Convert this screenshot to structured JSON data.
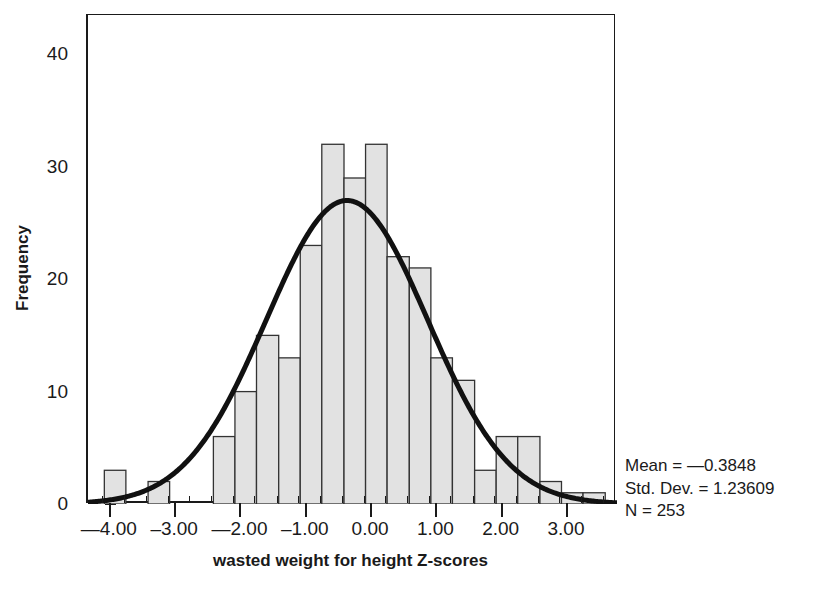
{
  "chart_data": {
    "type": "bar",
    "subtype": "histogram-with-normal-curve",
    "title": "",
    "xlabel": "wasted weight for height Z-scores",
    "ylabel": "Frequency",
    "xlim": [
      -4.35,
      3.75
    ],
    "ylim": [
      0,
      43.5
    ],
    "grid": false,
    "legend_position": "outside-right-bottom",
    "x_ticks": [
      -4.0,
      -3.0,
      -2.0,
      -1.0,
      0.0,
      1.0,
      2.0,
      3.0
    ],
    "x_tick_labels": [
      "—4.00",
      "–3.00",
      "—2.00",
      "–1.00",
      "0.00",
      "1.00",
      "2.00",
      "3.00"
    ],
    "y_ticks": [
      0,
      10,
      20,
      30,
      40
    ],
    "y_tick_labels": [
      "0",
      "10",
      "20",
      "30",
      "40"
    ],
    "bin_width": 0.3333,
    "bins": [
      {
        "x_left": -4.1,
        "x_right": -3.77,
        "value": 3
      },
      {
        "x_left": -3.77,
        "x_right": -3.43,
        "value": 0
      },
      {
        "x_left": -3.43,
        "x_right": -3.1,
        "value": 2
      },
      {
        "x_left": -3.1,
        "x_right": -2.77,
        "value": 0
      },
      {
        "x_left": -2.77,
        "x_right": -2.43,
        "value": 0
      },
      {
        "x_left": -2.43,
        "x_right": -2.1,
        "value": 6
      },
      {
        "x_left": -2.1,
        "x_right": -1.77,
        "value": 10
      },
      {
        "x_left": -1.77,
        "x_right": -1.43,
        "value": 15
      },
      {
        "x_left": -1.43,
        "x_right": -1.1,
        "value": 13
      },
      {
        "x_left": -1.1,
        "x_right": -0.77,
        "value": 23
      },
      {
        "x_left": -0.77,
        "x_right": -0.43,
        "value": 32
      },
      {
        "x_left": -0.43,
        "x_right": -0.1,
        "value": 29
      },
      {
        "x_left": -0.1,
        "x_right": 0.23,
        "value": 32
      },
      {
        "x_left": 0.23,
        "x_right": 0.57,
        "value": 22
      },
      {
        "x_left": 0.57,
        "x_right": 0.9,
        "value": 21
      },
      {
        "x_left": 0.9,
        "x_right": 1.23,
        "value": 13
      },
      {
        "x_left": 1.23,
        "x_right": 1.57,
        "value": 11
      },
      {
        "x_left": 1.57,
        "x_right": 1.9,
        "value": 3
      },
      {
        "x_left": 1.9,
        "x_right": 2.23,
        "value": 6
      },
      {
        "x_left": 2.23,
        "x_right": 2.57,
        "value": 6
      },
      {
        "x_left": 2.57,
        "x_right": 2.9,
        "value": 2
      },
      {
        "x_left": 2.9,
        "x_right": 3.23,
        "value": 1
      },
      {
        "x_left": 3.23,
        "x_right": 3.57,
        "value": 1
      }
    ],
    "normal_curve": {
      "mean": -0.3848,
      "std_dev": 1.23609,
      "n": 253,
      "peak_value": 27,
      "color": "#111111",
      "line_width": 5
    },
    "bar_fill": "#e2e2e2",
    "bar_stroke": "#333333"
  },
  "axes": {
    "y_title": "Frequency",
    "x_title": "wasted weight for height Z-scores"
  },
  "stats": {
    "mean_label": "Mean = —0.3848",
    "std_dev_label": "Std. Dev. = 1.23609",
    "n_label": "N = 253"
  }
}
